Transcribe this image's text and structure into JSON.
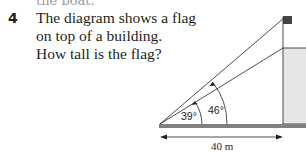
{
  "previous_text_cutoff": "the boat.",
  "question": {
    "number": "4",
    "lines": [
      "The diagram shows a flag",
      "on top of a building.",
      "How tall is the flag?"
    ]
  },
  "diagram": {
    "angle_small": "39°",
    "angle_large": "46°",
    "distance": "40 m",
    "colors": {
      "ground": "#808080",
      "building_fill": "#e6e6e6",
      "flag": "#444444",
      "line": "#231f20"
    }
  }
}
